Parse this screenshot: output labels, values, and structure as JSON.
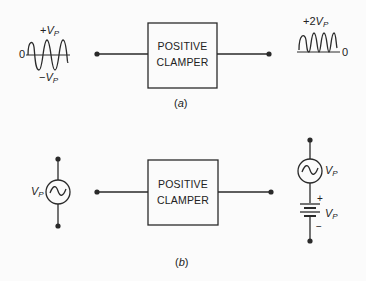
{
  "part_a": {
    "caption_open": "(",
    "caption_letter": "a",
    "caption_close": ")",
    "block_line1": "POSITIVE",
    "block_line2": "CLAMPER",
    "input": {
      "plus_label_sign": "+",
      "minus_label_sign": "−",
      "label_var": "V",
      "label_sub": "P",
      "zero": "0"
    },
    "output": {
      "label_prefix": "+2",
      "label_var": "V",
      "label_sub": "P",
      "zero": "0"
    }
  },
  "part_b": {
    "caption_open": "(",
    "caption_letter": "b",
    "caption_close": ")",
    "block_line1": "POSITIVE",
    "block_line2": "CLAMPER",
    "source_label_var": "V",
    "source_label_sub": "P",
    "output": {
      "ac_label_var": "V",
      "ac_label_sub": "P",
      "dc_label_var": "V",
      "dc_label_sub": "P",
      "plus": "+",
      "minus": "−"
    }
  },
  "colors": {
    "stroke": "#2a2a2a",
    "background": "#fbfbfb"
  }
}
